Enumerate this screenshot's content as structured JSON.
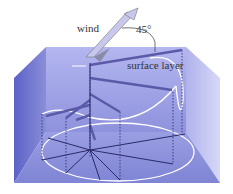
{
  "diagram": {
    "labels": {
      "wind": "wind",
      "angle": "45°",
      "surface_layer": "surface layer"
    },
    "colors": {
      "water_back": "#9c9ee6",
      "water_side_left": "#6a6fd0",
      "water_side_right": "#b8baf0",
      "floor": "#8a8ed8",
      "spiral_arrows": "#7b7bc4",
      "dark_lines": "#2a2a6a",
      "white_curves": "#ffffff"
    }
  }
}
